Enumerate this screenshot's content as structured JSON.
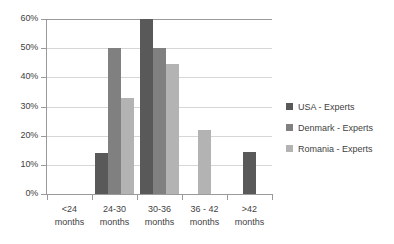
{
  "chart_data": {
    "type": "bar",
    "title": "",
    "subtitle": "",
    "xlabel": "",
    "ylabel": "",
    "ylim": [
      0,
      60
    ],
    "ytick_step": 10,
    "ytick_labels": [
      "0%",
      "10%",
      "20%",
      "30%",
      "40%",
      "50%",
      "60%"
    ],
    "grid": true,
    "legend_position": "right",
    "value_suffix": "%",
    "categories": [
      "<24 months",
      "24-30 months",
      "30-36 months",
      "36 - 42 months",
      ">42 months"
    ],
    "category_lines": [
      {
        "line1": "<24",
        "line2": "months"
      },
      {
        "line1": "24-30",
        "line2": "months"
      },
      {
        "line1": "30-36",
        "line2": "months"
      },
      {
        "line1": "36 - 42",
        "line2": "months"
      },
      {
        "line1": ">42",
        "line2": "months"
      }
    ],
    "series": [
      {
        "name": "USA - Experts",
        "color": "#595959",
        "values": [
          0,
          14,
          60,
          0,
          14.5
        ]
      },
      {
        "name": "Denmark - Experts",
        "color": "#808080",
        "values": [
          0,
          50,
          50,
          0,
          0
        ]
      },
      {
        "name": "Romania - Experts",
        "color": "#b3b3b3",
        "values": [
          0,
          33,
          44.5,
          22,
          0
        ]
      }
    ]
  },
  "colors": {
    "background": "#ffffff",
    "axis": "#9a9a9a",
    "gridline": "#d6d6d6",
    "text": "#3f3f3f"
  }
}
